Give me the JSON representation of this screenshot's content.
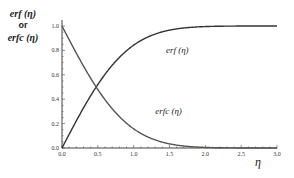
{
  "chart_data": {
    "type": "line",
    "title": "",
    "xlabel": "η",
    "ylabel_lines": [
      "erf (η)",
      "or",
      "erfc (η)"
    ],
    "xlim": [
      0.0,
      3.0
    ],
    "ylim": [
      0.0,
      1.0
    ],
    "x_ticks": [
      "0.0",
      "0.5",
      "1.0",
      "1.5",
      "2.0",
      "2.5",
      "3.0"
    ],
    "y_ticks": [
      "0.0",
      "0.2",
      "0.4",
      "0.6",
      "0.8",
      "1.0"
    ],
    "grid": false,
    "legend": "none",
    "x": [
      0.0,
      0.25,
      0.5,
      0.75,
      1.0,
      1.25,
      1.5,
      1.75,
      2.0,
      2.25,
      2.5,
      2.75,
      3.0
    ],
    "series": [
      {
        "name": "erf (η)",
        "values": [
          0.0,
          0.276,
          0.52,
          0.711,
          0.843,
          0.923,
          0.966,
          0.987,
          0.995,
          0.999,
          1.0,
          1.0,
          1.0
        ]
      },
      {
        "name": "erfc (η)",
        "values": [
          1.0,
          0.724,
          0.48,
          0.289,
          0.157,
          0.077,
          0.034,
          0.013,
          0.005,
          0.001,
          0.0,
          0.0,
          0.0
        ]
      }
    ],
    "annotations": [
      {
        "text": "erf (η)",
        "x": 1.45,
        "y": 0.78
      },
      {
        "text": "erfc (η)",
        "x": 1.3,
        "y": 0.28
      }
    ]
  }
}
